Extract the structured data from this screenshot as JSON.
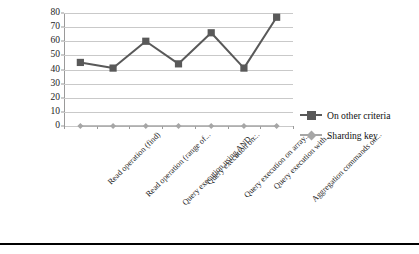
{
  "chart_data": {
    "type": "line",
    "title": "",
    "xlabel": "",
    "ylabel": "",
    "ylim": [
      0,
      80
    ],
    "yticks": [
      0,
      10,
      20,
      30,
      40,
      50,
      60,
      70,
      80
    ],
    "grid": true,
    "legend_position": "right",
    "categories": [
      "Read operation (find)",
      "Read operation (range of...",
      "Query execution using AND...",
      "Query execution on...",
      "Query execution on array...",
      "Query execution with...",
      "Aggregation commands on..."
    ],
    "series": [
      {
        "name": "On other criteria",
        "color": "#595959",
        "marker": "square",
        "values": [
          45,
          41,
          60,
          44,
          66,
          41,
          77
        ]
      },
      {
        "name": "Sharding key",
        "color": "#a6a6a6",
        "marker": "diamond",
        "values": [
          0,
          0,
          0,
          0,
          0,
          0,
          0
        ]
      }
    ]
  },
  "legend": {
    "items": [
      {
        "label": "On other criteria"
      },
      {
        "label": "Sharding key"
      }
    ]
  },
  "axis": {
    "y_tick_labels": [
      "80",
      "70",
      "60",
      "50",
      "40",
      "30",
      "20",
      "10",
      "0"
    ]
  },
  "colors": {
    "series_primary": "#595959",
    "series_secondary": "#a6a6a6",
    "gridline": "#c9c9c9",
    "axis": "#9a9a9a",
    "text": "#1c1c1c",
    "rule": "#000000"
  }
}
